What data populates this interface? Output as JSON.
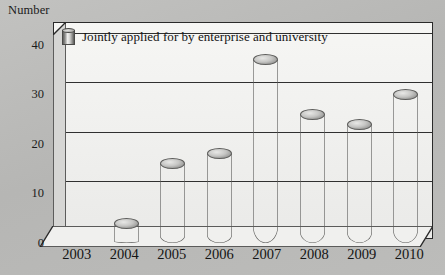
{
  "axis": {
    "y_title": "Number",
    "y_ticks": [
      "0",
      "10",
      "20",
      "30",
      "40"
    ]
  },
  "legend": {
    "swatch_icon": "cylinder-bar-icon",
    "label": "Jointly applied for by enterprise and university"
  },
  "colors": {
    "background": "#bcbcba",
    "plot_background": "#f2f2f0",
    "frame": "#2a2a2a",
    "gridline": "#303030",
    "bar_light": "#fbfbf9",
    "bar_dark": "#6a6a68",
    "text": "#141414"
  },
  "chart_data": {
    "type": "bar",
    "title": "",
    "subtitle": "",
    "xlabel": "",
    "ylabel": "Number",
    "categories": [
      "2003",
      "2004",
      "2005",
      "2006",
      "2007",
      "2008",
      "2009",
      "2010"
    ],
    "values": [
      0,
      4,
      16,
      18,
      37,
      26,
      24,
      30
    ],
    "series": [
      {
        "name": "Jointly applied for by enterprise and university",
        "values": [
          0,
          4,
          16,
          18,
          37,
          26,
          24,
          30
        ]
      }
    ],
    "ylim": [
      0,
      43
    ],
    "yticks": [
      0,
      10,
      20,
      30,
      40
    ],
    "grid": true,
    "legend_position": "top-left",
    "style": "3d-cylinder"
  }
}
